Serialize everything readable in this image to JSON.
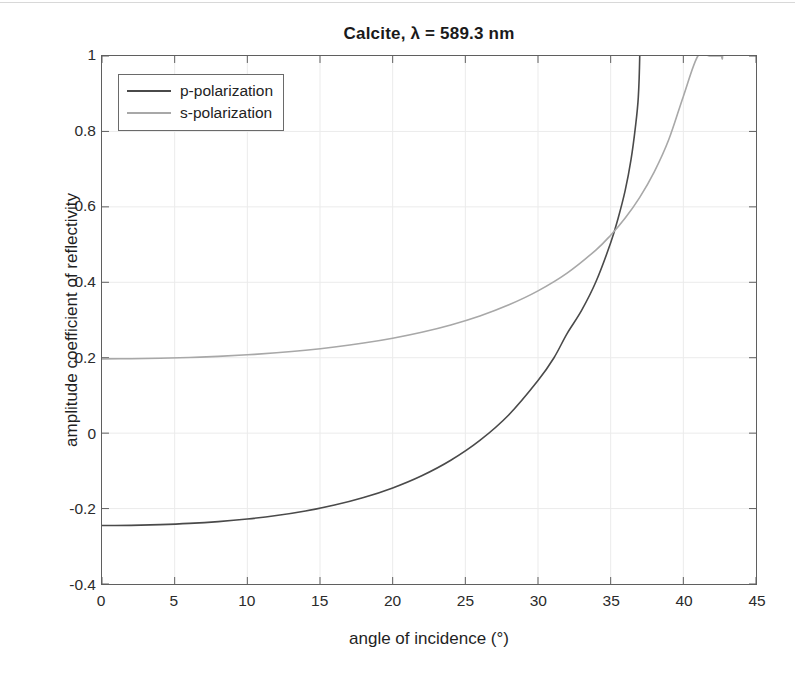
{
  "figure": {
    "title": "Calcite, λ = 589.3 nm",
    "background": "#ffffff",
    "axis_color": "#5f5f5f",
    "grid_color": "#ebebeb"
  },
  "legend": {
    "position": "top-left",
    "entries": [
      {
        "label": "p-polarization",
        "color": "#4a4a4a"
      },
      {
        "label": "s-polarization",
        "color": "#a8a8a8"
      }
    ]
  },
  "axes": {
    "x": {
      "title": "angle of incidence (°)",
      "ticks": [
        0,
        5,
        10,
        15,
        20,
        25,
        30,
        35,
        40,
        45
      ],
      "tick_labels": [
        "0",
        "5",
        "10",
        "15",
        "20",
        "25",
        "30",
        "35",
        "40",
        "45"
      ],
      "min": 0,
      "max": 45
    },
    "y": {
      "title": "amplitude coefficient of reflectivity",
      "ticks": [
        -0.4,
        -0.2,
        0,
        0.2,
        0.4,
        0.6,
        0.8,
        1
      ],
      "tick_labels": [
        "-0.4",
        "-0.2",
        "0",
        "0.2",
        "0.4",
        "0.6",
        "0.8",
        "1"
      ],
      "min": -0.4,
      "max": 1
    }
  },
  "chart_data": {
    "type": "line",
    "title": "Calcite, λ = 589.3 nm",
    "xlabel": "angle of incidence (°)",
    "ylabel": "amplitude coefficient of reflectivity",
    "xlim": [
      0,
      45
    ],
    "ylim": [
      -0.4,
      1
    ],
    "grid": true,
    "legend_position": "top-left",
    "annotations": {
      "p_brewster_angle_deg": 31.1,
      "p_reaches_unity_deg": 37.0,
      "s_reaches_unity_deg": 42.7,
      "curve_crossing": {
        "x": 36.2,
        "y": 0.43
      }
    },
    "series": [
      {
        "name": "p-polarization",
        "color": "#4a4a4a",
        "x": [
          0,
          2,
          4,
          6,
          8,
          10,
          12,
          14,
          16,
          18,
          20,
          22,
          24,
          26,
          28,
          30,
          31.1,
          32,
          33,
          34,
          35,
          35.5,
          36,
          36.4,
          36.7,
          36.9,
          37.0
        ],
        "y": [
          -0.245,
          -0.2445,
          -0.2425,
          -0.2393,
          -0.2345,
          -0.2277,
          -0.2185,
          -0.2064,
          -0.1907,
          -0.1707,
          -0.1452,
          -0.1129,
          -0.0718,
          -0.0192,
          0.0489,
          0.1394,
          0.2,
          0.264,
          0.3254,
          0.4026,
          0.5046,
          0.568,
          0.6436,
          0.7252,
          0.8108,
          0.8897,
          1.0
        ]
      },
      {
        "name": "s-polarization",
        "color": "#a8a8a8",
        "x": [
          0,
          2,
          4,
          6,
          8,
          10,
          12,
          14,
          16,
          18,
          20,
          22,
          24,
          26,
          28,
          30,
          32,
          34,
          35,
          36,
          37,
          38,
          39,
          40,
          41,
          41.8,
          42.3,
          42.6,
          42.7
        ],
        "y": [
          0.197,
          0.1974,
          0.1986,
          0.2006,
          0.2036,
          0.2077,
          0.2131,
          0.2199,
          0.2284,
          0.2389,
          0.2518,
          0.2676,
          0.287,
          0.3108,
          0.3403,
          0.3772,
          0.4243,
          0.4862,
          0.5249,
          0.5705,
          0.6253,
          0.6928,
          0.7786,
          0.8929,
          1.0,
          1.0,
          1.0,
          1.0,
          1.0
        ]
      }
    ]
  }
}
